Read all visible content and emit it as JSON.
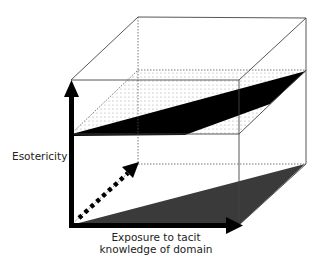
{
  "diagram": {
    "type": "3d-cube-diagram",
    "labels": {
      "y_axis": "Esotericity",
      "x_axis_line1": "Exposure to tacit",
      "x_axis_line2": "knowledge of domain"
    },
    "colors": {
      "edges": "#444444",
      "axis": "#000000",
      "upper_slab": "#000000",
      "lower_triangle": "#3a3a3a",
      "dotted_plane": "#888888"
    }
  }
}
